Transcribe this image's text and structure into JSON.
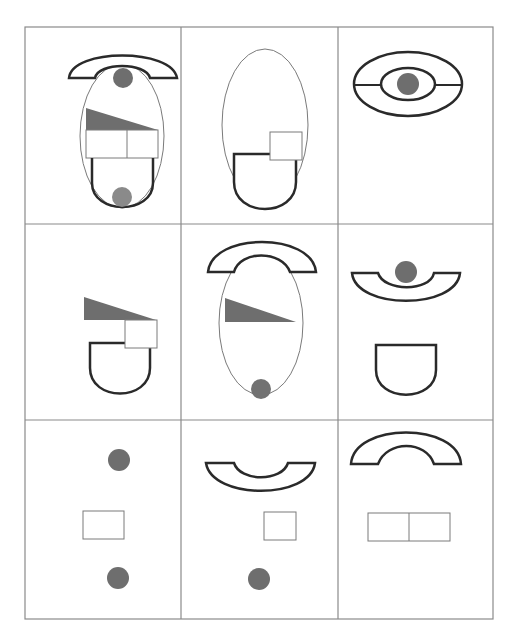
{
  "puzzle": {
    "rows": 3,
    "cols": 3,
    "colors": {
      "background": "#ffffff",
      "grid_line": "#8a8a8a",
      "thick_stroke": "#2a2a2a",
      "thin_stroke": "#7a7a7a",
      "fill_dark": "#6e6e6e",
      "fill_circle": "#727272"
    },
    "grid": {
      "x": [
        25,
        181,
        338,
        493
      ],
      "y": [
        27,
        224,
        420,
        619
      ]
    },
    "cells": [
      {
        "id": "r1c1",
        "shapes": [
          "arch-top",
          "circle-top",
          "large-oval",
          "shaded-triangle",
          "double-rect",
          "u-cup",
          "circle-bottom"
        ]
      },
      {
        "id": "r1c2",
        "shapes": [
          "large-oval",
          "small-square",
          "u-cup"
        ]
      },
      {
        "id": "r1c3",
        "shapes": [
          "eye-oval",
          "circle-center"
        ]
      },
      {
        "id": "r2c1",
        "shapes": [
          "shaded-triangle",
          "small-square",
          "u-cup"
        ]
      },
      {
        "id": "r2c2",
        "shapes": [
          "arch-top",
          "large-oval",
          "shaded-triangle",
          "circle-bottom"
        ]
      },
      {
        "id": "r2c3",
        "shapes": [
          "bowl-arch",
          "circle-top",
          "u-cup"
        ]
      },
      {
        "id": "r3c1",
        "shapes": [
          "circle-top",
          "small-rect",
          "circle-bottom"
        ]
      },
      {
        "id": "r3c2",
        "shapes": [
          "bowl-arch",
          "small-square",
          "circle-bottom"
        ]
      },
      {
        "id": "r3c3",
        "shapes": [
          "arch-top",
          "double-rect"
        ]
      }
    ]
  }
}
